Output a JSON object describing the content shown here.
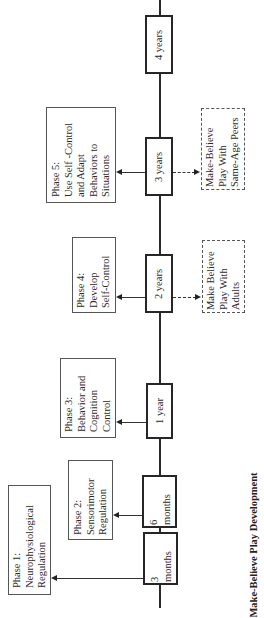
{
  "title": "Make-Believe Play Development",
  "orientation": "rotated -90deg (reads bottom-to-top)",
  "timeline": {
    "milestones": [
      {
        "label_lines": [
          "3",
          "months"
        ]
      },
      {
        "label_lines": [
          "6",
          "months"
        ]
      },
      {
        "label_lines": [
          "1 year"
        ]
      },
      {
        "label_lines": [
          "2 years"
        ]
      },
      {
        "label_lines": [
          "3 years"
        ]
      },
      {
        "label_lines": [
          "4 years"
        ]
      }
    ]
  },
  "phases": [
    {
      "lines": [
        "Phase 1:",
        "Neurophysiological",
        "Regulation"
      ],
      "linked_to": "3 months"
    },
    {
      "lines": [
        "Phase 2:",
        "Sensorimotor",
        "Regulation"
      ],
      "linked_to": "6 months"
    },
    {
      "lines": [
        "Phase 3:",
        "Behavior and",
        "Cognition",
        "Control"
      ],
      "linked_to": "1 year"
    },
    {
      "lines": [
        "Phase 4:",
        "Develop",
        "Self-Control"
      ],
      "linked_to": "2 years"
    },
    {
      "lines": [
        "Phase 5:",
        "Use Self -Control",
        "and Adapt",
        "Behaviors to",
        "Situations"
      ],
      "linked_to": "3 years"
    }
  ],
  "play_types": [
    {
      "lines": [
        "Make Believe",
        "Play With",
        "Adults"
      ],
      "linked_to": "2 years"
    },
    {
      "lines": [
        "Make-Believe",
        "Play With",
        "Same-Age Peers"
      ],
      "linked_to": "3 years"
    }
  ],
  "colors": {
    "line": "#2b2b2b",
    "box_border": "#262626",
    "phase_border": "#555555",
    "text": "#2a2a2a",
    "background": "#ffffff"
  }
}
